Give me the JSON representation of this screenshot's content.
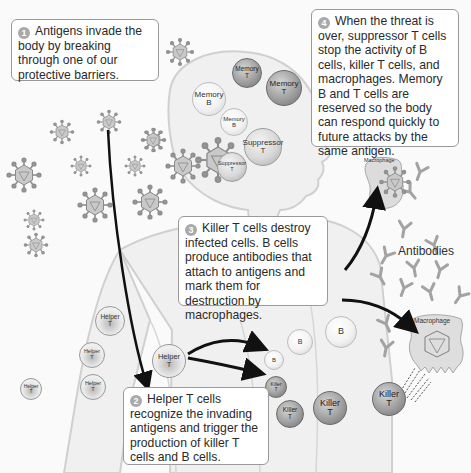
{
  "steps": [
    {
      "number": "1",
      "text": "Antigens invade the body by breaking through one of our protective barriers."
    },
    {
      "number": "2",
      "text": "Helper T cells recognize the invading antigens and trigger the production of killer T cells and B cells."
    },
    {
      "number": "3",
      "text": "Killer T cells destroy infected cells.  B cells produce antibodies that attach to antigens and mark them for destruction by macrophages."
    },
    {
      "number": "4",
      "text": "When the threat is over, suppressor T cells stop the activity of B cells, killer T cells, and macrophages.  Memory B and T cells are reserved so the body can respond quickly to future attacks by the same antigen."
    }
  ],
  "cells": {
    "memory_t_1": {
      "line1": "Memory",
      "line2": "T"
    },
    "memory_t_2": {
      "line1": "Memory",
      "line2": "T"
    },
    "memory_b_1": {
      "line1": "Memory",
      "line2": "B"
    },
    "memory_b_2": {
      "line1": "Memory",
      "line2": "B"
    },
    "suppressor_t_1": {
      "line1": "Suppressor",
      "line2": "T"
    },
    "suppressor_t_2": {
      "line1": "Suppressor",
      "line2": "T"
    },
    "helper_t": {
      "line1": "Helper",
      "line2": "T"
    },
    "b": {
      "line1": "B"
    },
    "killer_t": {
      "line1": "Killer",
      "line2": "T"
    }
  },
  "labels": {
    "macrophage": "Macrophage",
    "antibodies": "Antibodies"
  },
  "colors": {
    "box_border": "#9a9a9a",
    "step_badge": "#a9a9a9",
    "arrow": "#111111",
    "body_outline": "#d0d0d0"
  }
}
